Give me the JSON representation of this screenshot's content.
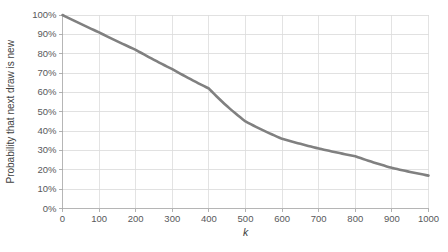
{
  "chart_data": {
    "type": "line",
    "title": "",
    "xlabel": "k",
    "ylabel": "Probability that next draw is new",
    "xlim": [
      0,
      1000
    ],
    "ylim": [
      0,
      1
    ],
    "grid": true,
    "legend": null,
    "line_color": "#808080",
    "grid_color": "#d9d9d9",
    "axis_color": "#b0b0b0",
    "xticks": [
      0,
      100,
      200,
      300,
      400,
      500,
      600,
      700,
      800,
      900,
      1000
    ],
    "xtick_labels": [
      "0",
      "100",
      "200",
      "300",
      "400",
      "500",
      "600",
      "700",
      "800",
      "900",
      "1000"
    ],
    "yticks": [
      0,
      0.1,
      0.2,
      0.3,
      0.4,
      0.5,
      0.6,
      0.7,
      0.8,
      0.9,
      1.0
    ],
    "ytick_labels": [
      "0%",
      "10%",
      "20%",
      "30%",
      "40%",
      "50%",
      "60%",
      "70%",
      "80%",
      "90%",
      "100%"
    ],
    "series": [
      {
        "name": "Probability that next draw is new",
        "x": [
          0,
          50,
          100,
          150,
          200,
          250,
          300,
          350,
          400,
          450,
          500,
          550,
          600,
          650,
          700,
          750,
          800,
          850,
          900,
          950,
          1000
        ],
        "values": [
          1.0,
          0.955,
          0.905,
          0.855,
          0.815,
          0.765,
          0.725,
          0.685,
          0.645,
          0.605,
          0.455,
          0.425,
          0.395,
          0.365,
          0.345,
          0.315,
          0.275,
          0.245,
          0.215,
          0.185,
          0.165
        ]
      }
    ],
    "curve_points_percent": {
      "0": 100,
      "100": 91,
      "200": 82,
      "300": 72,
      "400": 62,
      "500": 45,
      "600": 36,
      "700": 31,
      "800": 27,
      "900": 21,
      "1000": 17
    }
  }
}
